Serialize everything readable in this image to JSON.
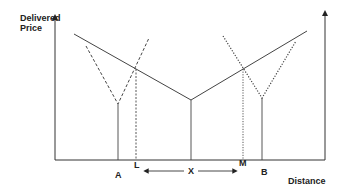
{
  "diagram": {
    "y_axis_label_line1": "Delivered",
    "y_axis_label_line2": "Price",
    "x_axis_label": "Distance",
    "points": {
      "A": "A",
      "L": "L",
      "X": "X",
      "M": "M",
      "B": "B"
    },
    "lines": [
      {
        "name": "central-delivered-price-V",
        "style": "solid",
        "vertex": "X"
      },
      {
        "name": "firm-A-delivered-price-V",
        "style": "dashed",
        "vertex": "A"
      },
      {
        "name": "firm-B-delivered-price-V",
        "style": "dotted",
        "vertex": "B"
      }
    ],
    "colors": {
      "ink": "#333333",
      "background": "#ffffff"
    }
  }
}
